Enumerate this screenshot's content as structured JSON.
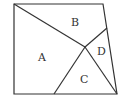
{
  "diagram": {
    "type": "quadrilateral-partition",
    "outline": [
      [
        14,
        4
      ],
      [
        103,
        4
      ],
      [
        117,
        94
      ],
      [
        14,
        94
      ]
    ],
    "segments": [
      {
        "from": [
          14,
          4
        ],
        "to": [
          85,
          47
        ]
      },
      {
        "from": [
          85,
          47
        ],
        "to": [
          117,
          94
        ]
      },
      {
        "from": [
          85,
          47
        ],
        "to": [
          107,
          28
        ]
      },
      {
        "from": [
          85,
          47
        ],
        "to": [
          54,
          94
        ]
      }
    ],
    "regions": [
      {
        "label": "A",
        "x": 42,
        "y": 61
      },
      {
        "label": "B",
        "x": 75,
        "y": 26
      },
      {
        "label": "C",
        "x": 84,
        "y": 83
      },
      {
        "label": "D",
        "x": 101,
        "y": 55
      }
    ]
  }
}
